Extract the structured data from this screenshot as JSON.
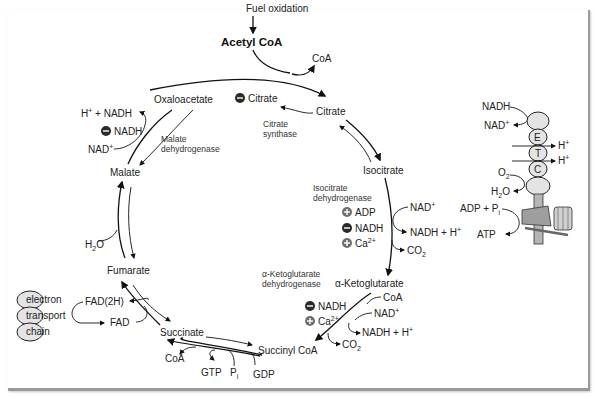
{
  "diagram": {
    "title_input": "Fuel oxidation",
    "entry_metabolite": "Acetyl CoA",
    "metabolites": {
      "citrate": "Citrate",
      "isocitrate": "Isocitrate",
      "alpha_ketoglutarate": "α-Ketoglutarate",
      "succinyl_coa": "Succinyl CoA",
      "succinate": "Succinate",
      "fumarate": "Fumarate",
      "malate": "Malate",
      "oxaloacetate": "Oxaloacetate"
    },
    "enzymes": {
      "citrate_synthase": [
        "Citrate",
        "synthase"
      ],
      "isocitrate_dehydrogenase": [
        "Isocitrate",
        "dehydrogenase"
      ],
      "akg_dehydrogenase": [
        "α-Ketoglutarate",
        "dehydrogenase"
      ],
      "malate_dehydrogenase": [
        "Malate",
        "dehydrogenase"
      ]
    },
    "regulators": {
      "citrate_synthase": [
        {
          "sign": "-",
          "label": "Citrate"
        }
      ],
      "isocitrate_dehydrogenase": [
        {
          "sign": "+",
          "label": "ADP"
        },
        {
          "sign": "-",
          "label": "NADH"
        },
        {
          "sign": "+",
          "label": "Ca2+"
        }
      ],
      "akg_dehydrogenase": [
        {
          "sign": "-",
          "label": "NADH"
        },
        {
          "sign": "+",
          "label": "Ca2+"
        }
      ],
      "malate_dehydrogenase": [
        {
          "sign": "-",
          "label": "NADH"
        }
      ]
    },
    "side_species": {
      "coa_out_citrate": "CoA",
      "nad_in_icdh": "NAD+",
      "nadh_out_icdh": "NADH + H+",
      "co2_out_icdh": "CO2",
      "coa_in_akg": "CoA",
      "nad_in_akg": "NAD+",
      "nadh_out_akg": "NADH + H+",
      "co2_out_akg": "CO2",
      "coa_out_succ": "CoA",
      "gtp": "GTP",
      "pi": "Pi",
      "gdp": "GDP",
      "fad2h": "FAD(2H)",
      "fad": "FAD",
      "h2o": "H2O",
      "nad_in_mdh": "NAD+",
      "nadh_out_mdh": "H+ + NADH"
    },
    "electron_transport_chain": [
      "electron",
      "transport",
      "chain"
    ],
    "oxphos": {
      "nadh": "NADH",
      "nad": "NAD+",
      "complexes": [
        "E",
        "T",
        "C"
      ],
      "h_plus_1": "H+",
      "h_plus_2": "H+",
      "o2": "O2",
      "h2o": "H2O",
      "adp_pi": "ADP + Pi",
      "atp": "ATP"
    },
    "colors": {
      "line": "#111111",
      "regulator_badge": "#3a3a3a",
      "positive_badge": "#6e6e6e",
      "complex_fill": "#e4e4e4",
      "synthase_fill": "#b5b5b5"
    }
  }
}
